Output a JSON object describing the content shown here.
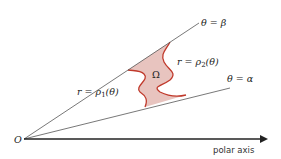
{
  "diagram": {
    "labels": {
      "origin": "O",
      "polar_axis": "polar axis",
      "ray_beta": "θ = β",
      "ray_alpha": "θ = α",
      "inner_curve": "r = ρ1(θ)",
      "outer_curve": "r = ρ2(θ)",
      "region": "Ω"
    },
    "colors": {
      "region_fill": "#e8c4bf",
      "boundary": "#c0392b",
      "lines": "#555555",
      "axis": "#222222",
      "text": "#222222"
    }
  }
}
